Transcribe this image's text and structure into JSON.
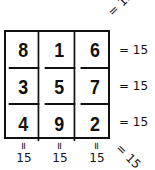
{
  "magic_square": {
    "rows": [
      [
        8,
        1,
        6
      ],
      [
        3,
        5,
        7
      ],
      [
        4,
        9,
        2
      ]
    ],
    "magic_constant": 15
  },
  "cells": {
    "r0c0": "8",
    "r0c1": "1",
    "r0c2": "6",
    "r1c0": "3",
    "r1c1": "5",
    "r1c2": "7",
    "r2c0": "4",
    "r2c1": "9",
    "r2c2": "2"
  },
  "row_sums": [
    {
      "label": "= 15"
    },
    {
      "label": "= 15"
    },
    {
      "label": "= 15"
    }
  ],
  "column_sums": [
    {
      "eq": "=",
      "value": "15"
    },
    {
      "eq": "=",
      "value": "15"
    },
    {
      "eq": "=",
      "value": "15"
    }
  ],
  "diagonal_sums": {
    "anti_diagonal": "= 15",
    "main_diagonal": "= 15"
  }
}
